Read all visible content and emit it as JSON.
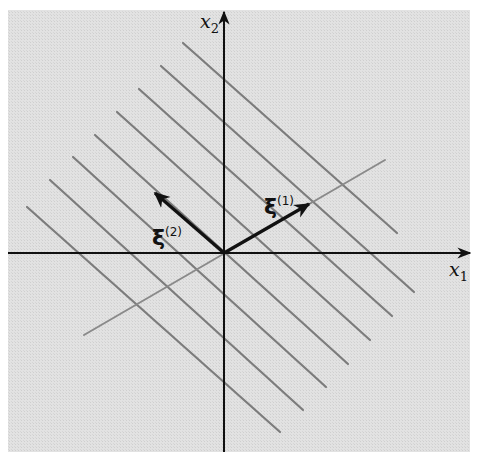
{
  "figure": {
    "background_color": "#dedede",
    "plot_area": {
      "x": 8,
      "y": 10,
      "width": 462,
      "height": 442
    },
    "origin": {
      "x": 224,
      "y": 253
    },
    "axes": {
      "x1": {
        "label": "x",
        "subscript": "1",
        "from": [
          8,
          253
        ],
        "to": [
          470,
          253
        ]
      },
      "x2": {
        "label": "x",
        "subscript": "2",
        "from": [
          224,
          452
        ],
        "to": [
          224,
          12
        ]
      }
    },
    "vectors": [
      {
        "name": "xi-1",
        "symbol": "ξ",
        "superscript": "(1)",
        "from": [
          224,
          253
        ],
        "to": [
          309,
          204
        ]
      },
      {
        "name": "xi-2",
        "symbol": "ξ",
        "superscript": "(2)",
        "from": [
          224,
          253
        ],
        "to": [
          155,
          193
        ]
      }
    ],
    "xi1_direction_line": {
      "from": [
        84,
        335
      ],
      "to": [
        385,
        160
      ],
      "color": "#8a8a8a"
    },
    "parallel_lines": {
      "color": "#7c7c7c",
      "lines": [
        {
          "from": [
            183,
            43
          ],
          "to": [
            397,
            233
          ]
        },
        {
          "from": [
            161,
            66
          ],
          "to": [
            414,
            292
          ]
        },
        {
          "from": [
            139,
            89
          ],
          "to": [
            392,
            316
          ]
        },
        {
          "from": [
            117,
            112
          ],
          "to": [
            370,
            340
          ]
        },
        {
          "from": [
            95,
            135
          ],
          "to": [
            348,
            364
          ]
        },
        {
          "from": [
            73,
            157
          ],
          "to": [
            326,
            387
          ]
        },
        {
          "from": [
            50,
            180
          ],
          "to": [
            303,
            410
          ]
        },
        {
          "from": [
            27,
            207
          ],
          "to": [
            280,
            432
          ]
        }
      ]
    }
  },
  "labels": {
    "x1": {
      "base": "x",
      "sub": "1"
    },
    "x2": {
      "base": "x",
      "sub": "2"
    },
    "xi1": {
      "base": "ξ",
      "sup": "(1)"
    },
    "xi2": {
      "base": "ξ",
      "sup": "(2)"
    }
  }
}
